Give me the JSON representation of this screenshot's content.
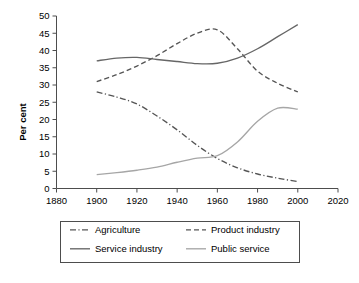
{
  "chart_data": {
    "type": "line",
    "title": "",
    "xlabel": "",
    "ylabel": "Per cent",
    "xlim": [
      1880,
      2020
    ],
    "ylim": [
      0,
      50
    ],
    "xticks": [
      1880,
      1900,
      1920,
      1940,
      1960,
      1980,
      2000,
      2020
    ],
    "yticks": [
      0,
      5,
      10,
      15,
      20,
      25,
      30,
      35,
      40,
      45,
      50
    ],
    "grid": false,
    "legend_position": "bottom",
    "x": [
      1900,
      1910,
      1920,
      1930,
      1940,
      1950,
      1960,
      1970,
      1980,
      1990,
      2000
    ],
    "series": [
      {
        "name": "Agriculture",
        "style": "dash-dot",
        "color": "#555555",
        "values": [
          28.0,
          26.5,
          24.5,
          21.0,
          17.0,
          12.5,
          8.7,
          6.0,
          4.2,
          3.0,
          2.0
        ]
      },
      {
        "name": "Product industry",
        "style": "dashed",
        "color": "#555555",
        "values": [
          31.0,
          33.0,
          35.5,
          38.5,
          42.0,
          45.0,
          46.0,
          40.5,
          34.0,
          30.5,
          28.0
        ]
      },
      {
        "name": "Service industry",
        "style": "solid",
        "color": "#666666",
        "values": [
          37.0,
          37.8,
          38.0,
          37.4,
          36.8,
          36.2,
          36.3,
          37.8,
          40.5,
          44.0,
          47.5
        ]
      },
      {
        "name": "Public service",
        "style": "solid",
        "color": "#a6a6a6",
        "values": [
          4.0,
          4.6,
          5.3,
          6.2,
          7.6,
          8.8,
          9.5,
          13.5,
          19.5,
          23.3,
          23.0
        ]
      }
    ]
  },
  "axes": {
    "y_title": "Per cent",
    "y_tick_labels": [
      "0",
      "5",
      "10",
      "15",
      "20",
      "25",
      "30",
      "35",
      "40",
      "45",
      "50"
    ],
    "x_tick_labels": [
      "1880",
      "1900",
      "1920",
      "1940",
      "1960",
      "1980",
      "2000",
      "2020"
    ]
  },
  "legend": {
    "entries": [
      {
        "label": "Agriculture",
        "style": "dash-dot",
        "color": "#555555"
      },
      {
        "label": "Product industry",
        "style": "dashed",
        "color": "#555555"
      },
      {
        "label": "Service industry",
        "style": "solid",
        "color": "#666666"
      },
      {
        "label": "Public service",
        "style": "solid",
        "color": "#a6a6a6"
      }
    ]
  }
}
